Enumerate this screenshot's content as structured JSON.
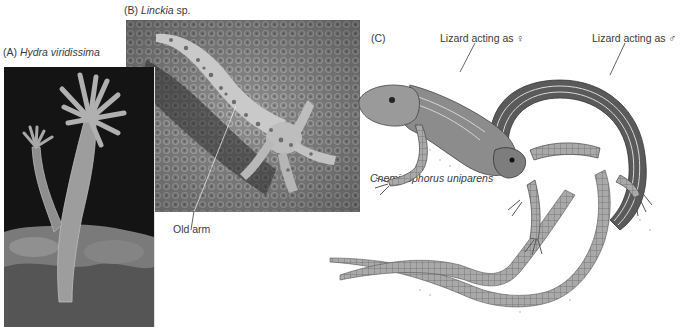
{
  "figure": {
    "panels": [
      {
        "id": "A",
        "letter": "(A)",
        "species": "Hydra viridissima"
      },
      {
        "id": "B",
        "letter": "(B)",
        "species": "Linckia",
        "species_suffix": "sp.",
        "annotation": "Old arm"
      },
      {
        "id": "C",
        "letter": "(C)",
        "species": "Cnemidophorus uniparens",
        "annotations": {
          "female_role": "Lizard acting as ♀",
          "male_role": "Lizard acting as ♂"
        }
      }
    ]
  },
  "colors": {
    "label_text": "#3a3a3a",
    "photo_dark": "#1a1a1a",
    "photo_mid": "#8a8a8a",
    "illustration_stroke": "#4a4a4a"
  }
}
